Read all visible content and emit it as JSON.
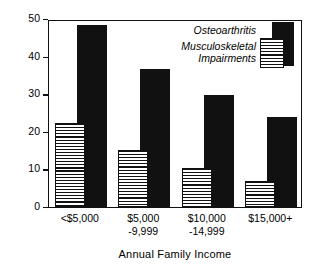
{
  "chart_data": {
    "type": "bar",
    "title": "",
    "xlabel": "Annual Family Income",
    "ylabel": "Percent",
    "ylim": [
      0,
      50
    ],
    "yticks": [
      0,
      10,
      20,
      30,
      40,
      50
    ],
    "grid": false,
    "legend_position": "top-right",
    "categories": [
      {
        "line1": "<$5,000",
        "line2": ""
      },
      {
        "line1": "$5,000",
        "line2": "-9,999"
      },
      {
        "line1": "$10,000",
        "line2": "-14,999"
      },
      {
        "line1": "$15,000+",
        "line2": ""
      }
    ],
    "series": [
      {
        "name": "Musculoskeletal Impairments",
        "name_line1": "Musculoskeletal",
        "name_line2": "Impairments",
        "style": "striped",
        "color": "#111111",
        "values": [
          22.3,
          15.1,
          10.3,
          7.0
        ]
      },
      {
        "name": "Osteoarthritis",
        "name_line1": "Osteoarthritis",
        "name_line2": "",
        "style": "solid",
        "color": "#111111",
        "values": [
          48.5,
          36.8,
          29.7,
          24.0
        ]
      }
    ]
  },
  "axis": {
    "y_title": "Percent",
    "x_title": "Annual Family Income",
    "y_tick_labels": [
      "0",
      "10",
      "20",
      "30",
      "40",
      "50"
    ]
  },
  "legend": {
    "osteoarthritis_label": "Osteoarthritis",
    "musculoskeletal_line1": "Musculoskeletal",
    "musculoskeletal_line2": "Impairments"
  }
}
